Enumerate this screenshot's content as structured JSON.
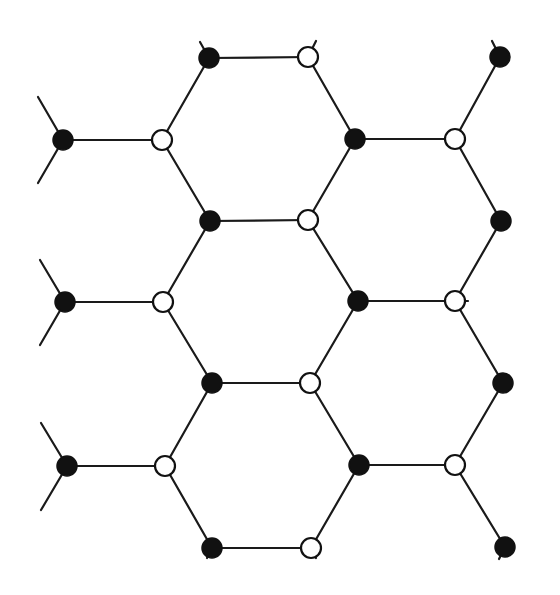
{
  "diagram": {
    "title": "",
    "type": "honeycomb-lattice",
    "colors": {
      "background": "#ffffff",
      "bond": "#1a1a1a",
      "site_a_fill": "#111111",
      "site_b_fill": "#ffffff",
      "site_b_stroke": "#111111"
    },
    "node_radius": 10,
    "nodes": [
      {
        "id": "a1",
        "kind": "filled",
        "x": 209,
        "y": 58
      },
      {
        "id": "b1",
        "kind": "open",
        "x": 308,
        "y": 57
      },
      {
        "id": "a2",
        "kind": "filled",
        "x": 500,
        "y": 57
      },
      {
        "id": "a3",
        "kind": "filled",
        "x": 63,
        "y": 140
      },
      {
        "id": "b2",
        "kind": "open",
        "x": 162,
        "y": 140
      },
      {
        "id": "a4",
        "kind": "filled",
        "x": 355,
        "y": 139
      },
      {
        "id": "b3",
        "kind": "open",
        "x": 455,
        "y": 139
      },
      {
        "id": "a5",
        "kind": "filled",
        "x": 210,
        "y": 221
      },
      {
        "id": "b4",
        "kind": "open",
        "x": 308,
        "y": 220
      },
      {
        "id": "a6",
        "kind": "filled",
        "x": 501,
        "y": 221
      },
      {
        "id": "a7",
        "kind": "filled",
        "x": 65,
        "y": 302
      },
      {
        "id": "b5",
        "kind": "open",
        "x": 163,
        "y": 302
      },
      {
        "id": "a8",
        "kind": "filled",
        "x": 358,
        "y": 301
      },
      {
        "id": "b6",
        "kind": "open",
        "x": 455,
        "y": 301
      },
      {
        "id": "a9",
        "kind": "filled",
        "x": 212,
        "y": 383
      },
      {
        "id": "b7",
        "kind": "open",
        "x": 310,
        "y": 383
      },
      {
        "id": "a10",
        "kind": "filled",
        "x": 503,
        "y": 383
      },
      {
        "id": "a11",
        "kind": "filled",
        "x": 67,
        "y": 466
      },
      {
        "id": "b8",
        "kind": "open",
        "x": 165,
        "y": 466
      },
      {
        "id": "a12",
        "kind": "filled",
        "x": 359,
        "y": 465
      },
      {
        "id": "b9",
        "kind": "open",
        "x": 455,
        "y": 465
      },
      {
        "id": "a13",
        "kind": "filled",
        "x": 212,
        "y": 548
      },
      {
        "id": "b10",
        "kind": "open",
        "x": 311,
        "y": 548
      },
      {
        "id": "a14",
        "kind": "filled",
        "x": 505,
        "y": 547
      }
    ],
    "bonds": [
      [
        "a1",
        "b1"
      ],
      [
        "b2",
        "a1"
      ],
      [
        "b1",
        "a4"
      ],
      [
        "a3",
        "b2"
      ],
      [
        "a4",
        "b3"
      ],
      [
        "b3",
        "a2"
      ],
      [
        "b2",
        "a5"
      ],
      [
        "b3",
        "a6"
      ],
      [
        "a5",
        "b4"
      ],
      [
        "b4",
        "a4"
      ],
      [
        "b5",
        "a5"
      ],
      [
        "b4",
        "a8"
      ],
      [
        "b6",
        "a6"
      ],
      [
        "a7",
        "b5"
      ],
      [
        "a8",
        "b6"
      ],
      [
        "b5",
        "a9"
      ],
      [
        "b6",
        "a10"
      ],
      [
        "a9",
        "b7"
      ],
      [
        "b7",
        "a8"
      ],
      [
        "b8",
        "a9"
      ],
      [
        "b7",
        "a12"
      ],
      [
        "b9",
        "a10"
      ],
      [
        "a11",
        "b8"
      ],
      [
        "a12",
        "b9"
      ],
      [
        "b8",
        "a13"
      ],
      [
        "b9",
        "a14"
      ],
      [
        "a13",
        "b10"
      ],
      [
        "b10",
        "a12"
      ]
    ],
    "stubs": [
      {
        "from": "a1",
        "x2": 200,
        "y2": 42
      },
      {
        "from": "b1",
        "x2": 316,
        "y2": 41
      },
      {
        "from": "a2",
        "x2": 492,
        "y2": 41
      },
      {
        "from": "a3",
        "x2": 38,
        "y2": 97
      },
      {
        "from": "a3",
        "x2": 38,
        "y2": 183
      },
      {
        "from": "a7",
        "x2": 40,
        "y2": 260
      },
      {
        "from": "a7",
        "x2": 40,
        "y2": 345
      },
      {
        "from": "a11",
        "x2": 41,
        "y2": 423
      },
      {
        "from": "a11",
        "x2": 41,
        "y2": 510
      },
      {
        "from": "b6",
        "x2": 468,
        "y2": 301
      },
      {
        "from": "a13",
        "x2": 207,
        "y2": 558
      },
      {
        "from": "b10",
        "x2": 316,
        "y2": 558
      },
      {
        "from": "a14",
        "x2": 499,
        "y2": 559
      }
    ]
  }
}
